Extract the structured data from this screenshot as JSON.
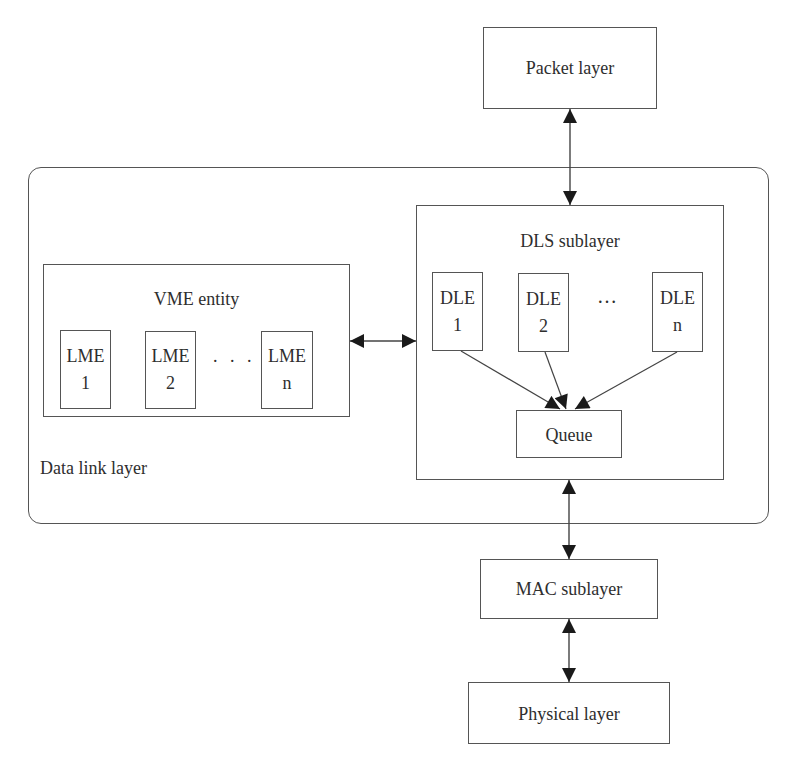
{
  "diagram": {
    "packet_layer": {
      "label": "Packet layer"
    },
    "data_link_layer": {
      "label": "Data link layer",
      "vme_entity": {
        "label": "VME entity",
        "lmes": [
          {
            "name": "LME",
            "index": "1"
          },
          {
            "name": "LME",
            "index": "2"
          },
          {
            "name": "LME",
            "index": "n"
          }
        ],
        "ellipsis": ". . ."
      },
      "dls_sublayer": {
        "label": "DLS sublayer",
        "dles": [
          {
            "name": "DLE",
            "index": "1"
          },
          {
            "name": "DLE",
            "index": "2"
          },
          {
            "name": "DLE",
            "index": "n"
          }
        ],
        "ellipsis": "…",
        "queue": {
          "label": "Queue"
        }
      }
    },
    "mac_sublayer": {
      "label": "MAC sublayer"
    },
    "physical_layer": {
      "label": "Physical layer"
    },
    "connections": [
      {
        "from": "Packet layer",
        "to": "DLS sublayer",
        "type": "bidirectional"
      },
      {
        "from": "VME entity",
        "to": "DLS sublayer",
        "type": "bidirectional"
      },
      {
        "from": "DLE 1",
        "to": "Queue",
        "type": "directed"
      },
      {
        "from": "DLE 2",
        "to": "Queue",
        "type": "directed"
      },
      {
        "from": "DLE n",
        "to": "Queue",
        "type": "directed"
      },
      {
        "from": "DLS sublayer",
        "to": "MAC sublayer",
        "type": "bidirectional"
      },
      {
        "from": "MAC sublayer",
        "to": "Physical layer",
        "type": "bidirectional"
      }
    ],
    "colors": {
      "line": "#555555",
      "text": "#2e2e2e",
      "background": "#ffffff"
    }
  }
}
